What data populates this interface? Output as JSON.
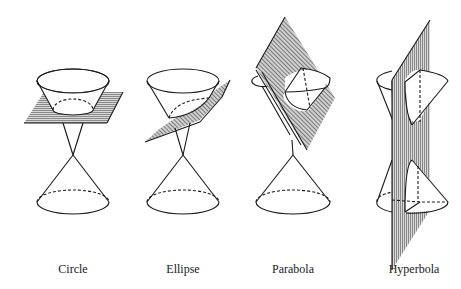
{
  "figure": {
    "panels": [
      {
        "id": "circle",
        "label": "Circle",
        "center_x": 73
      },
      {
        "id": "ellipse",
        "label": "Ellipse",
        "center_x": 183
      },
      {
        "id": "parabola",
        "label": "Parabola",
        "center_x": 293
      },
      {
        "id": "hyperbola",
        "label": "Hyperbola",
        "center_x": 414
      }
    ]
  },
  "colors": {
    "line": "#1a1a1a",
    "plane_fill": "#b0b0b0",
    "background": "#ffffff"
  }
}
